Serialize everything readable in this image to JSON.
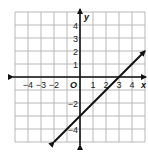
{
  "graph": {
    "x_range": [
      -5,
      5
    ],
    "y_range": [
      -5,
      5
    ],
    "x_tick_labels": [
      {
        "value": -4,
        "text": "−4"
      },
      {
        "value": -3,
        "text": "−3"
      },
      {
        "value": -2,
        "text": "−2"
      },
      {
        "value": 1,
        "text": "1"
      },
      {
        "value": 2,
        "text": "2"
      },
      {
        "value": 3,
        "text": "3"
      },
      {
        "value": 4,
        "text": "4"
      }
    ],
    "y_tick_labels": [
      {
        "value": 4,
        "text": "4"
      },
      {
        "value": 3,
        "text": "3"
      },
      {
        "value": 2,
        "text": "2"
      },
      {
        "value": 1,
        "text": "1"
      },
      {
        "value": -2,
        "text": "−2"
      },
      {
        "value": -4,
        "text": "−4"
      }
    ],
    "x_axis_label": "x",
    "y_axis_label": "y",
    "origin_label": "O",
    "line": {
      "equation": "y = x - 3",
      "slope": 1,
      "y_intercept": -3,
      "x_intercept": 3,
      "from": [
        -2,
        -5
      ],
      "to": [
        5,
        2
      ],
      "arrows": "both"
    },
    "colors": {
      "grid": "#b8b8b8",
      "axis": "#111111",
      "line": "#111111",
      "background": "#ffffff"
    }
  }
}
